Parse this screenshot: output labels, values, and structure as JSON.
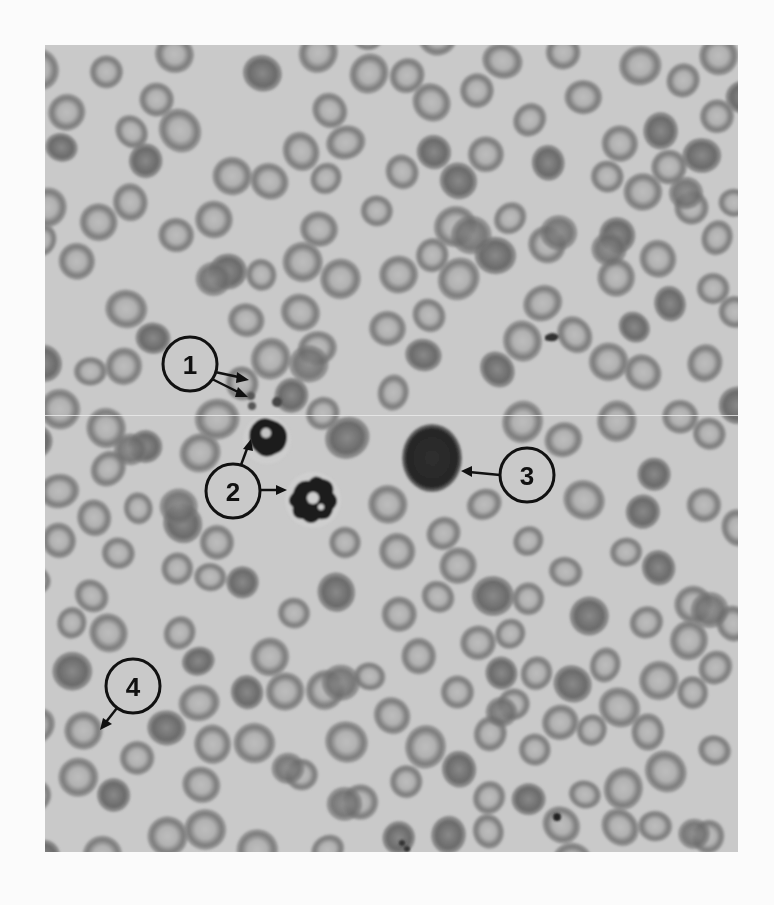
{
  "figure": {
    "type": "micrograph",
    "background_color": "#fbfbfb",
    "photo_bg": "#c9c9c9",
    "rbc_ring": "#6e6e6e",
    "rbc_center": "#b9b9b9",
    "dark_cell": "#2a2a2a",
    "callouts": [
      {
        "id": 1,
        "label": "1",
        "x": 190,
        "y": 364,
        "points_to": "platelets"
      },
      {
        "id": 2,
        "label": "2",
        "x": 233,
        "y": 491,
        "points_to": "neutrophils"
      },
      {
        "id": 3,
        "label": "3",
        "x": 527,
        "y": 475,
        "points_to": "lymphocyte"
      },
      {
        "id": 4,
        "label": "4",
        "x": 133,
        "y": 686,
        "points_to": "red-blood-cell"
      }
    ]
  }
}
